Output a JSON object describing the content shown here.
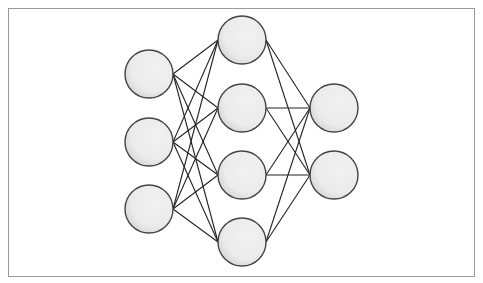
{
  "diagram": {
    "type": "neural-network",
    "layers": [
      {
        "name": "input",
        "nodes": [
          {
            "cx": 149,
            "cy": 74
          },
          {
            "cx": 149,
            "cy": 142
          },
          {
            "cx": 149,
            "cy": 209
          }
        ]
      },
      {
        "name": "hidden",
        "nodes": [
          {
            "cx": 242,
            "cy": 40
          },
          {
            "cx": 242,
            "cy": 108
          },
          {
            "cx": 242,
            "cy": 175
          },
          {
            "cx": 242,
            "cy": 242
          }
        ]
      },
      {
        "name": "output",
        "nodes": [
          {
            "cx": 334,
            "cy": 108
          },
          {
            "cx": 334,
            "cy": 175
          }
        ]
      }
    ],
    "node_radius": 24,
    "fully_connected": true,
    "colors": {
      "node_fill": "#ececec",
      "node_shade": "#d6d6d6",
      "node_stroke": "#444444",
      "edge": "#222222",
      "frame_border": "#9a9a9a"
    }
  }
}
